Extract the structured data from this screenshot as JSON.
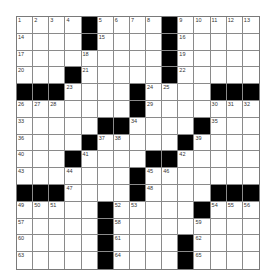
{
  "puzzle": {
    "rows": 15,
    "cols": 15,
    "grid": [
      "....#....#.....",
      "....#....#.....",
      ".........#.....",
      "...#.....#.....",
      "###....#....###",
      ".......#.......",
      ".....##....#...",
      "....#.....#....",
      "...#....##.....",
      ".......#.......",
      "###....#....###",
      ".....#.....#...",
      ".....#.........",
      ".....#....#....",
      ".....#....#...."
    ],
    "numbers": [
      {
        "row": 0,
        "col": 0,
        "n": 1
      },
      {
        "row": 0,
        "col": 1,
        "n": 2
      },
      {
        "row": 0,
        "col": 2,
        "n": 3
      },
      {
        "row": 0,
        "col": 3,
        "n": 4
      },
      {
        "row": 0,
        "col": 5,
        "n": 5
      },
      {
        "row": 0,
        "col": 6,
        "n": 6
      },
      {
        "row": 0,
        "col": 7,
        "n": 7
      },
      {
        "row": 0,
        "col": 8,
        "n": 8
      },
      {
        "row": 0,
        "col": 10,
        "n": 9
      },
      {
        "row": 0,
        "col": 11,
        "n": 10
      },
      {
        "row": 0,
        "col": 12,
        "n": 11
      },
      {
        "row": 0,
        "col": 13,
        "n": 12
      },
      {
        "row": 0,
        "col": 14,
        "n": 13
      },
      {
        "row": 1,
        "col": 0,
        "n": 14
      },
      {
        "row": 1,
        "col": 5,
        "n": 15
      },
      {
        "row": 1,
        "col": 10,
        "n": 16
      },
      {
        "row": 2,
        "col": 0,
        "n": 17
      },
      {
        "row": 2,
        "col": 4,
        "n": 18
      },
      {
        "row": 2,
        "col": 10,
        "n": 19
      },
      {
        "row": 3,
        "col": 0,
        "n": 20
      },
      {
        "row": 3,
        "col": 4,
        "n": 21
      },
      {
        "row": 3,
        "col": 10,
        "n": 22
      },
      {
        "row": 4,
        "col": 3,
        "n": 23
      },
      {
        "row": 4,
        "col": 8,
        "n": 24
      },
      {
        "row": 4,
        "col": 9,
        "n": 25
      },
      {
        "row": 5,
        "col": 0,
        "n": 26
      },
      {
        "row": 5,
        "col": 1,
        "n": 27
      },
      {
        "row": 5,
        "col": 2,
        "n": 28
      },
      {
        "row": 5,
        "col": 8,
        "n": 29
      },
      {
        "row": 5,
        "col": 12,
        "n": 30
      },
      {
        "row": 5,
        "col": 13,
        "n": 31
      },
      {
        "row": 5,
        "col": 14,
        "n": 32
      },
      {
        "row": 6,
        "col": 0,
        "n": 33
      },
      {
        "row": 6,
        "col": 7,
        "n": 34
      },
      {
        "row": 6,
        "col": 12,
        "n": 35
      },
      {
        "row": 7,
        "col": 0,
        "n": 36
      },
      {
        "row": 7,
        "col": 5,
        "n": 37
      },
      {
        "row": 7,
        "col": 6,
        "n": 38
      },
      {
        "row": 7,
        "col": 11,
        "n": 39
      },
      {
        "row": 8,
        "col": 0,
        "n": 40
      },
      {
        "row": 8,
        "col": 4,
        "n": 41
      },
      {
        "row": 8,
        "col": 10,
        "n": 42
      },
      {
        "row": 9,
        "col": 0,
        "n": 43
      },
      {
        "row": 9,
        "col": 3,
        "n": 44
      },
      {
        "row": 9,
        "col": 8,
        "n": 45
      },
      {
        "row": 9,
        "col": 9,
        "n": 46
      },
      {
        "row": 10,
        "col": 3,
        "n": 47
      },
      {
        "row": 10,
        "col": 8,
        "n": 48
      },
      {
        "row": 11,
        "col": 0,
        "n": 49
      },
      {
        "row": 11,
        "col": 1,
        "n": 50
      },
      {
        "row": 11,
        "col": 2,
        "n": 51
      },
      {
        "row": 11,
        "col": 6,
        "n": 52
      },
      {
        "row": 11,
        "col": 7,
        "n": 53
      },
      {
        "row": 11,
        "col": 12,
        "n": 54
      },
      {
        "row": 11,
        "col": 13,
        "n": 55
      },
      {
        "row": 11,
        "col": 14,
        "n": 56
      },
      {
        "row": 12,
        "col": 0,
        "n": 57
      },
      {
        "row": 12,
        "col": 6,
        "n": 58
      },
      {
        "row": 12,
        "col": 11,
        "n": 59
      },
      {
        "row": 13,
        "col": 0,
        "n": 60
      },
      {
        "row": 13,
        "col": 6,
        "n": 61
      },
      {
        "row": 13,
        "col": 11,
        "n": 62
      },
      {
        "row": 14,
        "col": 0,
        "n": 63
      },
      {
        "row": 14,
        "col": 6,
        "n": 64
      },
      {
        "row": 14,
        "col": 11,
        "n": 65
      }
    ],
    "colors": {
      "black_square": "#000000",
      "white_square": "#ffffff",
      "grid_line": "#8a8a8a",
      "number_text": "#333333"
    }
  }
}
